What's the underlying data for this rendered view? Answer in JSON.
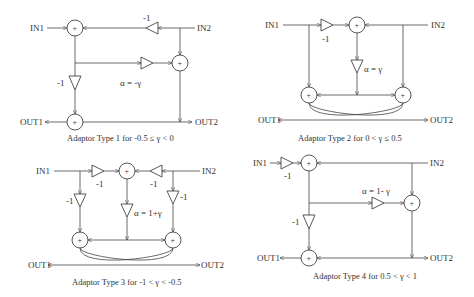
{
  "diagrams": [
    {
      "id": "type1",
      "caption": "Adaptor Type 1 for -0.5 ≤ γ < 0",
      "in1": "IN1",
      "in2": "IN2",
      "out1": "OUT1",
      "out2": "OUT2",
      "gain_labels": [
        "-1",
        "-1"
      ],
      "alpha_label": "α = -γ",
      "adder_symbol": "+"
    },
    {
      "id": "type2",
      "caption": "Adaptor Type 2 for 0 < γ ≤ 0.5",
      "in1": "IN1",
      "in2": "IN2",
      "out1": "OUT1",
      "out2": "OUT2",
      "gain_labels": [
        "-1"
      ],
      "alpha_label": "α = γ",
      "adder_symbol": "+"
    },
    {
      "id": "type3",
      "caption": "Adaptor Type 3 for -1 < γ < -0.5",
      "in1": "IN1",
      "in2": "IN2",
      "out1": "OUT1",
      "out2": "OUT2",
      "gain_labels": [
        "-1",
        "-1",
        "-1",
        "-1"
      ],
      "alpha_label": "α = 1+γ",
      "adder_symbol": "+"
    },
    {
      "id": "type4",
      "caption": "Adaptor Type 4 for 0.5 < γ < 1",
      "in1": "IN1",
      "in2": "IN2",
      "out1": "OUT1",
      "out2": "OUT2",
      "gain_labels": [
        "-1",
        "-1"
      ],
      "alpha_label": "α = 1- γ",
      "adder_symbol": "+"
    }
  ]
}
